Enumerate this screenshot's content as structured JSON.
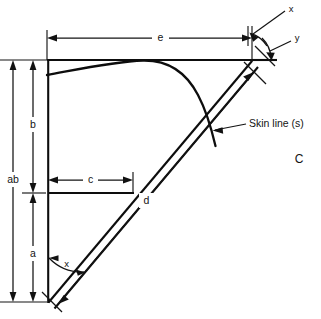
{
  "figure": {
    "panel_label": "C",
    "kind": "engineering-dimension-diagram",
    "background_color": "#ffffff",
    "line_color": "#0d0d0d"
  },
  "labels": {
    "overall_height": "ab",
    "upper_height": "b",
    "lower_height": "a",
    "inner_width": "c",
    "diagonal_length": "d",
    "top_width": "e",
    "angle_top_x": "x",
    "angle_top_y": "y",
    "angle_bottom_x": "x",
    "skin_line": "Skin line (s)"
  },
  "geometry": {
    "vertex_top_left": [
      47,
      60
    ],
    "vertex_top_right": [
      252,
      60
    ],
    "vertex_bottom_left": [
      47,
      302
    ],
    "shelf_y": 193,
    "shelf_right_x": 133,
    "dim_e_y": 38,
    "dim_ab_x": 13,
    "dim_b_x": 33,
    "dim_a_x": 33,
    "dim_c_y": 180,
    "skin_curve_start": [
      47,
      75
    ],
    "skin_curve_peak": [
      138,
      60
    ],
    "skin_curve_end": [
      215,
      145
    ]
  }
}
